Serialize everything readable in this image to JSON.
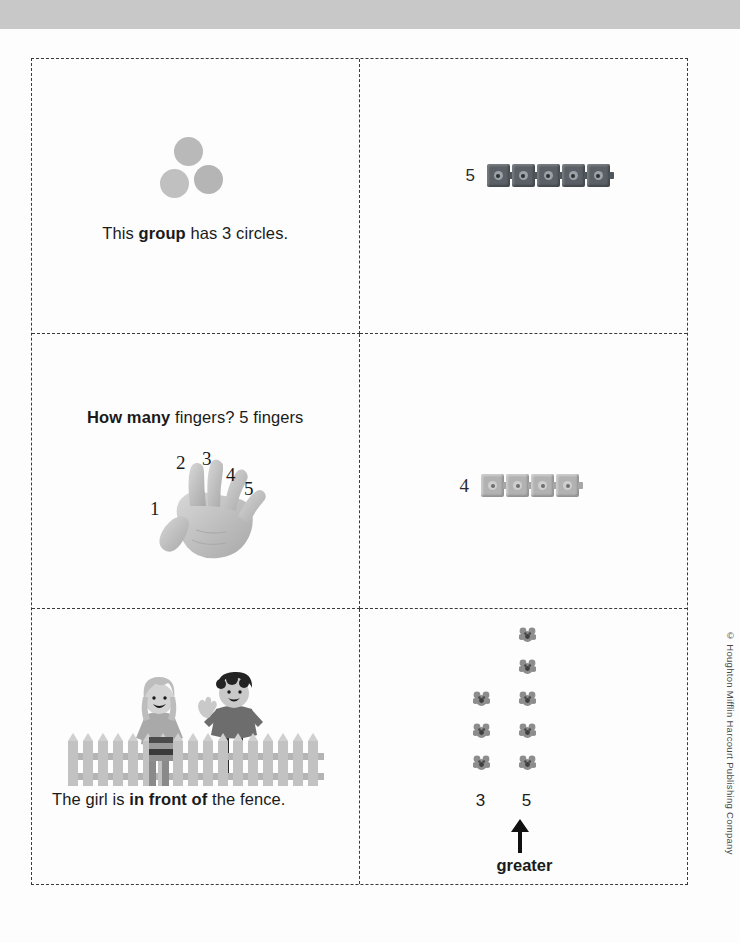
{
  "document": {
    "title": "Show What You Know — Vocabulary Cards",
    "copyright": "© Houghton Mifflin Harcourt Publishing Company",
    "top_bar_color": "#c8c8c8",
    "page_color": "#fdfdfd",
    "grid": {
      "columns": 2,
      "rows": 3,
      "border_style": "dashed",
      "border_color": "#3a3a3a"
    }
  },
  "cells": [
    {
      "id": "cell-group-circles",
      "position": "row1-col1",
      "art": "three-gray-circles",
      "circle_count": 3,
      "circle_color": "#b9b9b9",
      "caption": {
        "before": "This ",
        "bold": "group",
        "after": " has 3 circles."
      }
    },
    {
      "id": "cell-five-cubes",
      "position": "row1-col2",
      "art": "connecting-cubes",
      "label": "5",
      "cube_count": 5,
      "cube_color": "#5a6066"
    },
    {
      "id": "cell-how-many-fingers",
      "position": "row2-col1",
      "art": "hand-with-numbered-fingers",
      "caption": {
        "bold": "How many",
        "after": " fingers?  5 fingers"
      },
      "finger_numbers": [
        "1",
        "2",
        "3",
        "4",
        "5"
      ]
    },
    {
      "id": "cell-four-cubes",
      "position": "row2-col2",
      "art": "connecting-cubes",
      "label": "4",
      "cube_count": 4,
      "cube_color": "#b2b2b2"
    },
    {
      "id": "cell-in-front-of",
      "position": "row3-col1",
      "art": "girl-in-front-of-fence-with-boy-behind",
      "caption": {
        "before": "The girl is ",
        "bold": "in front of",
        "after": " the fence."
      }
    },
    {
      "id": "cell-greater",
      "position": "row3-col2",
      "art": "two-columns-of-flower-counters",
      "left_column": {
        "label": "3",
        "count": 3
      },
      "right_column": {
        "label": "5",
        "count": 5
      },
      "arrow": "up-arrow",
      "arrow_label": "greater"
    }
  ]
}
